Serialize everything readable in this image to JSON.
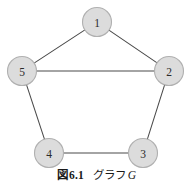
{
  "figure": {
    "caption_label": "図",
    "caption_number": "6.1",
    "caption_name": "グラフ",
    "caption_symbol": "G",
    "caption_full": "図 6.1  グラフ G"
  },
  "style": {
    "node_fill": "#dcdcdc",
    "node_stroke": "#b0b0b0",
    "edge_color": "#4a4a4a",
    "label_color": "#2b2b2b",
    "background": "#ffffff"
  },
  "chart_data": {
    "type": "diagram",
    "diagram_kind": "undirected-graph",
    "graph_name": "G",
    "node_count": 5,
    "edge_count": 6,
    "nodes": [
      {
        "id": "1",
        "label": "1",
        "x": 97,
        "y": 22,
        "r": 14.5
      },
      {
        "id": "2",
        "label": "2",
        "x": 169,
        "y": 71,
        "r": 14.5
      },
      {
        "id": "3",
        "label": "3",
        "x": 143,
        "y": 153,
        "r": 14.5
      },
      {
        "id": "4",
        "label": "4",
        "x": 49,
        "y": 153,
        "r": 14.5
      },
      {
        "id": "5",
        "label": "5",
        "x": 22,
        "y": 71,
        "r": 14.5
      }
    ],
    "edges": [
      {
        "source": "1",
        "target": "5"
      },
      {
        "source": "1",
        "target": "2"
      },
      {
        "source": "5",
        "target": "2"
      },
      {
        "source": "5",
        "target": "4"
      },
      {
        "source": "2",
        "target": "3"
      },
      {
        "source": "4",
        "target": "3"
      }
    ]
  }
}
